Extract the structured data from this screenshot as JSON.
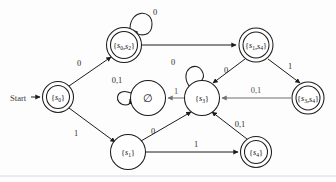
{
  "figure": {
    "type": "finite-state-automaton-diagram",
    "start_label": "Start",
    "background_color": "#fdfdfd",
    "stroke_color": "#1c1c1c",
    "gray_edge_color": "#6f6f6f"
  },
  "states": [
    {
      "id": "s0",
      "name": "state-s0",
      "label_open": "{",
      "label_base": "s",
      "label_sub": "0",
      "label_close": "}",
      "label_text": "{s0}",
      "accepting": true,
      "is_start": true,
      "cx": 58,
      "cy": 97,
      "r": 15.5
    },
    {
      "id": "s0s2",
      "name": "state-s0-s2",
      "label_open": "{",
      "label_base": "s",
      "label_sub": "0",
      "label_mid": ",s",
      "label_sub2": "2",
      "label_close": "}",
      "label_text": "{s0,s2}",
      "accepting": true,
      "is_start": false,
      "cx": 124,
      "cy": 45,
      "r": 17.5
    },
    {
      "id": "s1s4",
      "name": "state-s1-s4",
      "label_open": "{",
      "label_base": "s",
      "label_sub": "1",
      "label_mid": ",s",
      "label_sub2": "4",
      "label_close": "}",
      "label_text": "{s1,s4}",
      "accepting": true,
      "is_start": false,
      "cx": 256,
      "cy": 45,
      "r": 17.0
    },
    {
      "id": "s3s4",
      "name": "state-s3-s4",
      "label_open": "{",
      "label_base": "s",
      "label_sub": "3",
      "label_mid": ",s",
      "label_sub2": "4",
      "label_close": "}",
      "label_text": "{s3,s4}",
      "accepting": true,
      "is_start": false,
      "cx": 308,
      "cy": 98,
      "r": 16.0
    },
    {
      "id": "empty",
      "name": "state-empty-set",
      "label_text": "∅",
      "accepting": false,
      "is_start": false,
      "cx": 148,
      "cy": 98,
      "r": 17.5
    },
    {
      "id": "s3",
      "name": "state-s3",
      "label_open": "{",
      "label_base": "s",
      "label_sub": "3",
      "label_close": "}",
      "label_text": "{s3}",
      "accepting": false,
      "is_start": false,
      "cx": 202,
      "cy": 98,
      "r": 17.5
    },
    {
      "id": "s1",
      "name": "state-s1",
      "label_open": "{",
      "label_base": "s",
      "label_sub": "1",
      "label_close": "}",
      "label_text": "{s1}",
      "accepting": false,
      "is_start": false,
      "cx": 128,
      "cy": 152,
      "r": 17.5
    },
    {
      "id": "s4",
      "name": "state-s4",
      "label_open": "{",
      "label_base": "s",
      "label_sub": "4",
      "label_close": "}",
      "label_text": "{s4}",
      "accepting": true,
      "is_start": false,
      "cx": 256,
      "cy": 152,
      "r": 15.5
    }
  ],
  "transitions": [
    {
      "id": "t1",
      "name": "edge-s0-to-s0s2",
      "from": "s0",
      "to": "s0s2",
      "label": "0",
      "label_x": 79,
      "label_y": 63,
      "gray": false
    },
    {
      "id": "t2",
      "name": "edge-s0-to-s1",
      "from": "s0",
      "to": "s1",
      "label": "1",
      "label_x": 76,
      "label_y": 133,
      "gray": false
    },
    {
      "id": "t3",
      "name": "edge-s0s2-self-loop",
      "from": "s0s2",
      "to": "s0s2",
      "label": "0",
      "label_x": 153,
      "label_y": 12,
      "gray": false
    },
    {
      "id": "t4",
      "name": "edge-s0s2-to-s1s4",
      "from": "s0s2",
      "to": "s1s4",
      "label": "",
      "label_x": 190,
      "label_y": 38,
      "gray": false
    },
    {
      "id": "t5",
      "name": "edge-s1s4-to-s3",
      "from": "s1s4",
      "to": "s3",
      "label": "0",
      "label_x": 226,
      "label_y": 70,
      "gray": false
    },
    {
      "id": "t6",
      "name": "edge-s1s4-to-s3s4",
      "from": "s1s4",
      "to": "s3s4",
      "label": "1",
      "label_x": 290,
      "label_y": 66,
      "gray": false
    },
    {
      "id": "t7",
      "name": "edge-s3s4-to-s3",
      "from": "s3s4",
      "to": "s3",
      "label": "0,1",
      "label_x": 256,
      "label_y": 90,
      "gray": true
    },
    {
      "id": "t8",
      "name": "edge-s3-self-loop",
      "from": "s3",
      "to": "s3",
      "label": "0",
      "label_x": 173,
      "label_y": 62,
      "gray": false
    },
    {
      "id": "t9",
      "name": "edge-s3-to-empty",
      "from": "s3",
      "to": "empty",
      "label": "1",
      "label_x": 174,
      "label_y": 91,
      "gray": true
    },
    {
      "id": "t10",
      "name": "edge-empty-self-loop",
      "from": "empty",
      "to": "empty",
      "label": "0,1",
      "label_x": 115,
      "label_y": 80,
      "gray": false
    },
    {
      "id": "t11",
      "name": "edge-s1-to-s3",
      "from": "s1",
      "to": "s3",
      "label": "0",
      "label_x": 153,
      "label_y": 131,
      "gray": false
    },
    {
      "id": "t12",
      "name": "edge-s1-to-s4",
      "from": "s1",
      "to": "s4",
      "label": "1",
      "label_x": 196,
      "label_y": 144,
      "gray": false
    },
    {
      "id": "t13",
      "name": "edge-s4-to-s3",
      "from": "s4",
      "to": "s3",
      "label": "0,1",
      "label_x": 240,
      "label_y": 124,
      "gray": false
    }
  ]
}
